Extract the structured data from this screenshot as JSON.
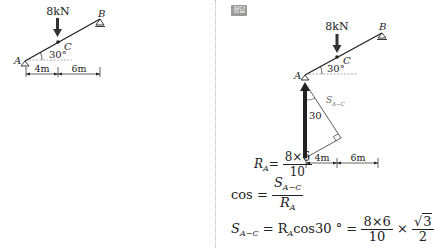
{
  "problem_figure": {
    "load_label": "8kN",
    "point_a": "A",
    "point_b": "B",
    "point_c": "C",
    "angle_label": "30°",
    "dim_left": "4m",
    "dim_right": "6m"
  },
  "answer": {
    "badge": "정답",
    "figure": {
      "load_label": "8kN",
      "point_a": "A",
      "point_b": "B",
      "point_c": "C",
      "angle_label": "30°",
      "inner_angle_label": "30",
      "shear_label": "S",
      "shear_sub": "A−C",
      "dim_left": "4m",
      "dim_right": "6m"
    },
    "ra_equation": {
      "lhs": "R",
      "lhs_sub": "A",
      "equals": "=",
      "numerator": "8×6",
      "denominator": "10"
    },
    "cos_equation": {
      "lhs": "cos =",
      "numerator": "S",
      "numerator_sub": "A−C",
      "denominator": "R",
      "denominator_sub": "A"
    },
    "shear_equation": {
      "lhs": "S",
      "lhs_sub": "A−C",
      "equals1": "= R",
      "r_sub": "A",
      "cos_term": "cos30 ° =",
      "frac1_num": "8×6",
      "frac1_den": "10",
      "times": "×",
      "frac2_num": "3",
      "frac2_den": "2"
    }
  },
  "colors": {
    "line": "#222222",
    "arrow": "#333333",
    "dashed": "#888888",
    "badge_bg": "#9a9a9a"
  }
}
